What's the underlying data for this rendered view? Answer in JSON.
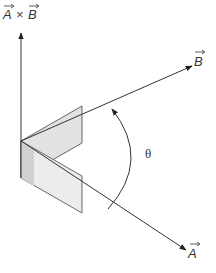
{
  "diagram": {
    "title_label": "A × B",
    "vectors": {
      "cross_product": {
        "label_left": "A",
        "operator": "×",
        "label_right": "B",
        "direction": "up"
      },
      "B": {
        "label": "B",
        "direction": "upper-right"
      },
      "A": {
        "label": "A",
        "direction": "lower-right"
      }
    },
    "angle_label": "θ",
    "colors": {
      "line": "#333333",
      "plane_fill": "#e0e0e0",
      "plane_fill_dark": "#cfcfcf"
    }
  }
}
